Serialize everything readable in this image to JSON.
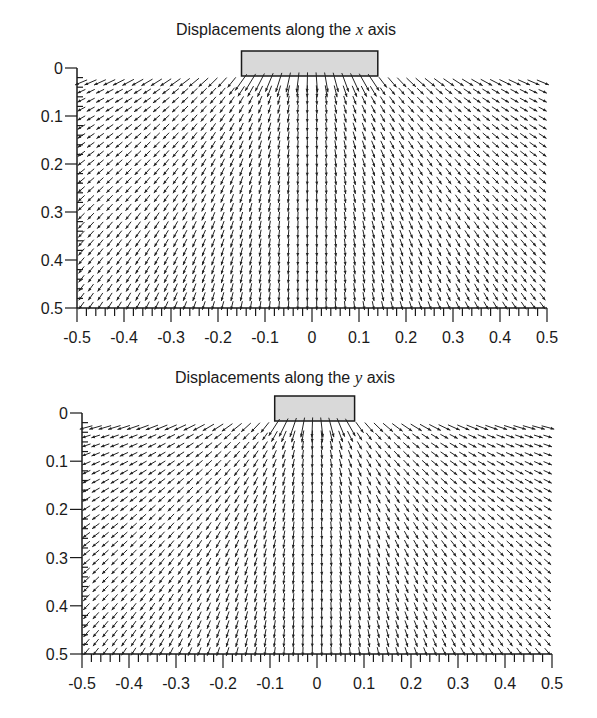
{
  "chart_data": [
    {
      "type": "quiver",
      "title_prefix": "Displacements along the ",
      "title_var": "x",
      "title_suffix": " axis",
      "xlabel": "",
      "ylabel": "",
      "xlim": [
        -0.5,
        0.5
      ],
      "ylim": [
        0.5,
        0
      ],
      "x_ticks": [
        "-0.5",
        "-0.4",
        "-0.3",
        "-0.2",
        "-0.1",
        "0",
        "0.1",
        "0.2",
        "0.3",
        "0.4",
        "0.5"
      ],
      "y_ticks": [
        "0",
        "0.1",
        "0.2",
        "0.3",
        "0.4",
        "0.5"
      ],
      "grid": false,
      "load_block": {
        "x_from": -0.15,
        "x_to": 0.14,
        "fill": "#d9d9d9"
      },
      "arrow_grid": {
        "cols": 50,
        "rows": 26
      },
      "description": "Vector field of displacements beneath a rigid strip load; arrows point downward and spread outward away from the loaded region"
    },
    {
      "type": "quiver",
      "title_prefix": "Displacements along the ",
      "title_var": "y",
      "title_suffix": " axis",
      "xlabel": "",
      "ylabel": "",
      "xlim": [
        -0.5,
        0.5
      ],
      "ylim": [
        0.5,
        0
      ],
      "x_ticks": [
        "-0.5",
        "-0.4",
        "-0.3",
        "-0.2",
        "-0.1",
        "0",
        "0.1",
        "0.2",
        "0.3",
        "0.4",
        "0.5"
      ],
      "y_ticks": [
        "0",
        "0.1",
        "0.2",
        "0.3",
        "0.4",
        "0.5"
      ],
      "grid": false,
      "load_block": {
        "x_from": -0.09,
        "x_to": 0.08,
        "fill": "#d9d9d9"
      },
      "arrow_grid": {
        "cols": 50,
        "rows": 26
      },
      "description": "Vector field of displacements beneath a narrower strip load; arrows point downward and spread outward away from the loaded region"
    }
  ],
  "layout": [
    {
      "top": 0,
      "title_x": 176,
      "title_y": 20,
      "ax_left": 77,
      "ax_right": 547,
      "ax_top": 68,
      "ax_bottom": 308,
      "block_top": 51,
      "block_bottom": 76
    },
    {
      "top": 0,
      "title_x": 175,
      "title_y": 368,
      "ax_left": 82,
      "ax_right": 552,
      "ax_top": 413,
      "ax_bottom": 654,
      "block_top": 396,
      "block_bottom": 421
    }
  ]
}
